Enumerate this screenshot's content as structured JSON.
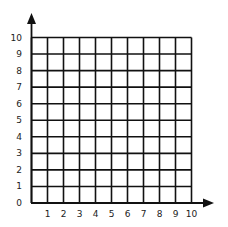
{
  "diagram": {
    "type": "coordinate-grid",
    "x_axis": {
      "min": 0,
      "max": 10,
      "tick_labels": [
        "1",
        "2",
        "3",
        "4",
        "5",
        "6",
        "7",
        "8",
        "9",
        "10"
      ],
      "arrow": true
    },
    "y_axis": {
      "min": 0,
      "max": 10,
      "tick_labels": [
        "0",
        "1",
        "2",
        "3",
        "4",
        "5",
        "6",
        "7",
        "8",
        "9",
        "10"
      ],
      "arrow": true
    },
    "origin_label": "0",
    "grid": {
      "rows": 10,
      "cols": 10
    },
    "colors": {
      "line": "#111111",
      "background": "#ffffff",
      "text": "#222222"
    }
  }
}
